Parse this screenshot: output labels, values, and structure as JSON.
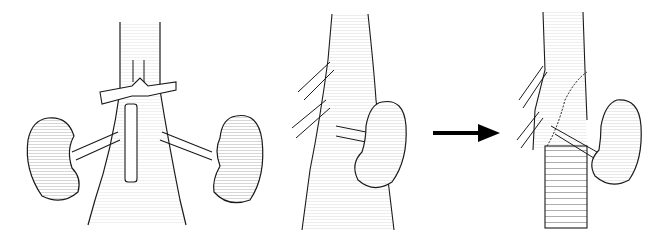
{
  "figure": {
    "type": "medical-illustration",
    "panels": [
      {
        "id": "panel-1",
        "view": "anterior",
        "subject": "aorta with bilateral kidneys, renal arteries, left renal vein crossing, and inferior mesenteric stump"
      },
      {
        "id": "panel-2",
        "view": "lateral",
        "subject": "aorta with visceral branches and single kidney with renal artery"
      },
      {
        "id": "panel-3",
        "view": "lateral",
        "subject": "aorta after graft replacement with beveled anastomosis and reimplanted renal artery"
      }
    ],
    "arrow": {
      "direction": "right",
      "color": "#000000"
    },
    "colors": {
      "line": "#1a1a1a",
      "hatch": "#555555",
      "background": "#ffffff"
    }
  }
}
